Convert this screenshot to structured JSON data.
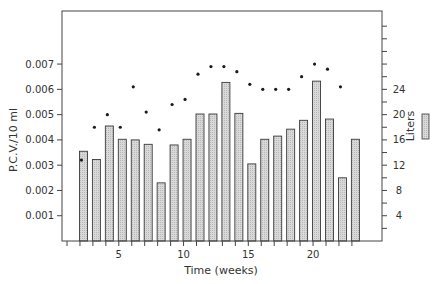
{
  "chart_data": {
    "type": "bar",
    "title": "",
    "xlabel": "Time (weeks)",
    "ylabel": "P.C.V./10 ml",
    "y2label": "Liters",
    "x_ticks": [
      5,
      10,
      15,
      20
    ],
    "x_range": [
      0,
      24
    ],
    "ylim": [
      0,
      0.0091
    ],
    "y_ticks": [
      "0.001",
      "0.002",
      "0.003",
      "0.004",
      "0.005",
      "0.006",
      "0.007"
    ],
    "y2lim": [
      0,
      36.4
    ],
    "y2_ticks": [
      "4",
      "8",
      "12",
      "16",
      "20",
      "24"
    ],
    "grid": false,
    "legend": {
      "position": "right",
      "entries": [
        "Liters"
      ]
    },
    "series": [
      {
        "name": "Liters",
        "type": "bar",
        "axis": "right",
        "x": [
          2,
          3,
          4,
          5,
          6,
          7,
          8,
          9,
          10,
          11,
          12,
          13,
          14,
          15,
          16,
          17,
          18,
          19,
          20,
          21,
          22,
          23
        ],
        "values": [
          14.2,
          12.9,
          18.2,
          16.1,
          16.0,
          15.3,
          9.2,
          15.2,
          16.1,
          20.1,
          20.1,
          25.1,
          20.2,
          12.2,
          16.1,
          16.6,
          17.7,
          19.1,
          25.3,
          19.3,
          10.0,
          16.1
        ]
      },
      {
        "name": "P.C.V./10 ml",
        "type": "scatter",
        "axis": "left",
        "x": [
          2,
          3,
          4,
          5,
          6,
          7,
          8,
          9,
          10,
          11,
          12,
          13,
          14,
          15,
          16,
          17,
          18,
          19,
          20,
          21,
          22
        ],
        "values": [
          0.0032,
          0.0045,
          0.005,
          0.0045,
          0.0061,
          0.0051,
          0.0044,
          0.0054,
          0.0056,
          0.0066,
          0.0069,
          0.0069,
          0.0067,
          0.0062,
          0.006,
          0.006,
          0.006,
          0.0065,
          0.007,
          0.0068,
          0.0061
        ]
      }
    ]
  },
  "colors": {
    "axis": "#444444",
    "bar_fill": "#d9d9d9",
    "bar_stroke": "#3a3a3a",
    "dot": "#1a1a1a"
  }
}
